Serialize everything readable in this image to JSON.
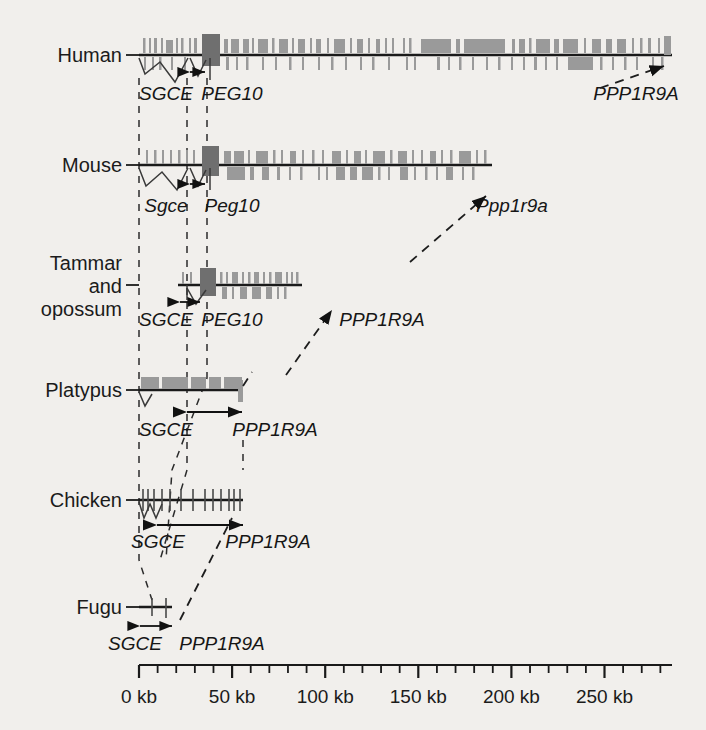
{
  "figure": {
    "background_color": "#f1efec",
    "line_color": "#1a1a1a",
    "exon_color": "#9a9a9a",
    "exon_dark_color": "#6f6f6f"
  },
  "axis": {
    "label_unit": "kb",
    "ticks": [
      {
        "value": 0,
        "label": "0 kb",
        "major": true
      },
      {
        "value": 10,
        "label": "",
        "major": false
      },
      {
        "value": 20,
        "label": "",
        "major": false
      },
      {
        "value": 30,
        "label": "",
        "major": false
      },
      {
        "value": 40,
        "label": "",
        "major": false
      },
      {
        "value": 50,
        "label": "50 kb",
        "major": true
      },
      {
        "value": 60,
        "label": "",
        "major": false
      },
      {
        "value": 70,
        "label": "",
        "major": false
      },
      {
        "value": 80,
        "label": "",
        "major": false
      },
      {
        "value": 90,
        "label": "",
        "major": false
      },
      {
        "value": 100,
        "label": "100 kb",
        "major": true
      },
      {
        "value": 110,
        "label": "",
        "major": false
      },
      {
        "value": 120,
        "label": "",
        "major": false
      },
      {
        "value": 130,
        "label": "",
        "major": false
      },
      {
        "value": 140,
        "label": "",
        "major": false
      },
      {
        "value": 150,
        "label": "150 kb",
        "major": true
      },
      {
        "value": 160,
        "label": "",
        "major": false
      },
      {
        "value": 170,
        "label": "",
        "major": false
      },
      {
        "value": 180,
        "label": "",
        "major": false
      },
      {
        "value": 190,
        "label": "",
        "major": false
      },
      {
        "value": 200,
        "label": "200 kb",
        "major": true
      },
      {
        "value": 210,
        "label": "",
        "major": false
      },
      {
        "value": 220,
        "label": "",
        "major": false
      },
      {
        "value": 230,
        "label": "",
        "major": false
      },
      {
        "value": 240,
        "label": "",
        "major": false
      },
      {
        "value": 250,
        "label": "250 kb",
        "major": true
      },
      {
        "value": 260,
        "label": "",
        "major": false
      },
      {
        "value": 270,
        "label": "",
        "major": false
      },
      {
        "value": 280,
        "label": "",
        "major": false
      }
    ],
    "range_kb": [
      0,
      287
    ]
  },
  "species": [
    {
      "id": "human",
      "name": "Human",
      "genes": [
        "SGCE",
        "PEG10",
        "PPP1R9A"
      ],
      "gene_case": "uppercase",
      "sgce_label": "SGCE",
      "peg10_label": "PEG10",
      "ppp1r9a_label": "PPP1R9A",
      "has_peg10": true,
      "ppp1r9a_offscale": true
    },
    {
      "id": "mouse",
      "name": "Mouse",
      "genes": [
        "Sgce",
        "Peg10",
        "Ppp1r9a"
      ],
      "gene_case": "lowercase",
      "sgce_label": "Sgce",
      "peg10_label": "Peg10",
      "ppp1r9a_label": "Ppp1r9a",
      "has_peg10": true,
      "ppp1r9a_offscale": true
    },
    {
      "id": "tammar-opossum",
      "name": "Tammar and opossum",
      "name_lines": [
        "Tammar",
        "and",
        "opossum"
      ],
      "genes": [
        "SGCE",
        "PEG10",
        "PPP1R9A"
      ],
      "gene_case": "uppercase",
      "sgce_label": "SGCE",
      "peg10_label": "PEG10",
      "ppp1r9a_label": "PPP1R9A",
      "has_peg10": true,
      "ppp1r9a_offscale": true
    },
    {
      "id": "platypus",
      "name": "Platypus",
      "genes": [
        "SGCE",
        "PPP1R9A"
      ],
      "gene_case": "uppercase",
      "sgce_label": "SGCE",
      "ppp1r9a_label": "PPP1R9A",
      "has_peg10": false,
      "ppp1r9a_offscale": false
    },
    {
      "id": "chicken",
      "name": "Chicken",
      "genes": [
        "SGCE",
        "PPP1R9A"
      ],
      "gene_case": "uppercase",
      "sgce_label": "SGCE",
      "ppp1r9a_label": "PPP1R9A",
      "has_peg10": false,
      "ppp1r9a_offscale": false
    },
    {
      "id": "fugu",
      "name": "Fugu",
      "genes": [
        "SGCE",
        "PPP1R9A"
      ],
      "gene_case": "uppercase",
      "sgce_label": "SGCE",
      "ppp1r9a_label": "PPP1R9A",
      "has_peg10": false,
      "ppp1r9a_offscale": false
    }
  ],
  "chart_data": {
    "type": "diagram",
    "xlabel": "Distance (kb)",
    "xlim": [
      0,
      287
    ],
    "rows": [
      {
        "species": "Human",
        "backbone_kb": [
          0,
          287
        ],
        "sgce_start_kb": 0,
        "peg10_kb": 30,
        "ppp1r9a_kb": 287,
        "repeat_density": "high"
      },
      {
        "species": "Mouse",
        "backbone_kb": [
          0,
          190
        ],
        "sgce_start_kb": 0,
        "peg10_kb": 30,
        "ppp1r9a_kb": 190,
        "repeat_density": "high"
      },
      {
        "species": "Tammar and opossum",
        "backbone_kb": [
          20,
          87
        ],
        "sgce_start_kb": 20,
        "peg10_kb": 30,
        "ppp1r9a_kb": 87,
        "repeat_density": "medium"
      },
      {
        "species": "Platypus",
        "backbone_kb": [
          0,
          55
        ],
        "sgce_start_kb": 0,
        "ppp1r9a_kb": 55,
        "repeat_density": "low"
      },
      {
        "species": "Chicken",
        "backbone_kb": [
          0,
          55
        ],
        "sgce_start_kb": 0,
        "ppp1r9a_kb": 55,
        "repeat_density": "none"
      },
      {
        "species": "Fugu",
        "backbone_kb": [
          0,
          12
        ],
        "sgce_start_kb": 0,
        "ppp1r9a_kb": 12,
        "repeat_density": "none"
      }
    ]
  }
}
